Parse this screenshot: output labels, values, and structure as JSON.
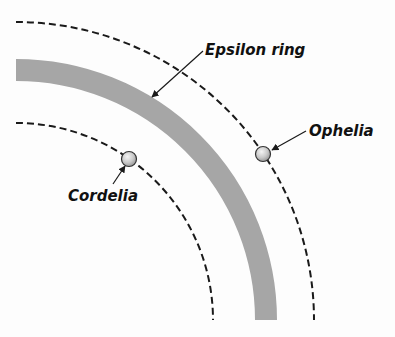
{
  "diagram": {
    "type": "orbital-schematic",
    "colors": {
      "background": "#fdfdfd",
      "ring": "#a6a6a6",
      "orbit": "#1a1a1a",
      "moon_fill": "#c8c8c8",
      "moon_stroke": "#333333",
      "text": "#111111"
    },
    "labels": {
      "ring": "Epsilon ring",
      "outer_moon": "Ophelia",
      "inner_moon": "Cordelia"
    },
    "elements": [
      {
        "kind": "orbit",
        "name": "Cordelia orbit",
        "style": "dashed",
        "radius_px": 197
      },
      {
        "kind": "ring",
        "name": "Epsilon ring",
        "style": "solid-band",
        "radius_px": 252,
        "width_px": 22
      },
      {
        "kind": "orbit",
        "name": "Ophelia orbit",
        "style": "dashed",
        "radius_px": 298
      },
      {
        "kind": "moon",
        "name": "Cordelia",
        "on": "inner orbit"
      },
      {
        "kind": "moon",
        "name": "Ophelia",
        "on": "outer orbit"
      }
    ]
  }
}
